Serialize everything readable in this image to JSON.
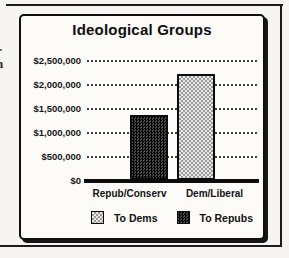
{
  "page": {
    "background_color": "#f6f5f1",
    "ink_color": "#141414",
    "margin_text_fragments": [
      "l",
      "-",
      "r",
      "n"
    ]
  },
  "chart_data": {
    "type": "bar",
    "title": "Ideological Groups",
    "categories": [
      "Repub/Conserv",
      "Dem/Liberal"
    ],
    "series": [
      {
        "name": "To Dems",
        "style": "light",
        "color": "#d4d4d4",
        "pattern": "light-checker-dither",
        "values": [
          0,
          2200000
        ]
      },
      {
        "name": "To Repubs",
        "style": "dark",
        "color": "#242424",
        "pattern": "dark-checker-dither",
        "values": [
          1350000,
          0
        ]
      }
    ],
    "ylim": [
      0,
      2500000
    ],
    "ytick_interval": 500000,
    "ytick_labels": [
      "$2,500,000",
      "$2,000,000",
      "$1,500,000",
      "$1,000,000",
      "$500,000",
      "$0"
    ],
    "xlabel": "",
    "ylabel": "",
    "grid": "horizontal-dotted",
    "legend_position": "bottom",
    "legend": [
      "To Dems",
      "To Repubs"
    ]
  }
}
